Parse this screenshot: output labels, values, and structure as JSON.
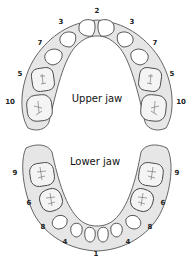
{
  "diagram": {
    "upper_jaw": {
      "label": "Upper jaw",
      "tooth_labels": [
        {
          "text": "2",
          "x": 97,
          "y": 13
        },
        {
          "text": "3",
          "x": 61,
          "y": 24
        },
        {
          "text": "3",
          "x": 132,
          "y": 24
        },
        {
          "text": "7",
          "x": 40,
          "y": 45
        },
        {
          "text": "7",
          "x": 155,
          "y": 45
        },
        {
          "text": "5",
          "x": 20,
          "y": 76
        },
        {
          "text": "5",
          "x": 172,
          "y": 76
        },
        {
          "text": "10",
          "x": 10,
          "y": 104
        },
        {
          "text": "10",
          "x": 181,
          "y": 104
        }
      ]
    },
    "lower_jaw": {
      "label": "Lower jaw",
      "tooth_labels": [
        {
          "text": "9",
          "x": 15,
          "y": 175
        },
        {
          "text": "9",
          "x": 177,
          "y": 175
        },
        {
          "text": "6",
          "x": 29,
          "y": 205
        },
        {
          "text": "6",
          "x": 163,
          "y": 205
        },
        {
          "text": "8",
          "x": 43,
          "y": 229
        },
        {
          "text": "8",
          "x": 150,
          "y": 229
        },
        {
          "text": "4",
          "x": 65,
          "y": 244
        },
        {
          "text": "4",
          "x": 128,
          "y": 244
        },
        {
          "text": "1",
          "x": 96,
          "y": 256
        }
      ]
    },
    "colors": {
      "gum": "#e6e6e6",
      "outline": "#444444",
      "tooth": "#ffffff",
      "text": "#222222"
    }
  }
}
